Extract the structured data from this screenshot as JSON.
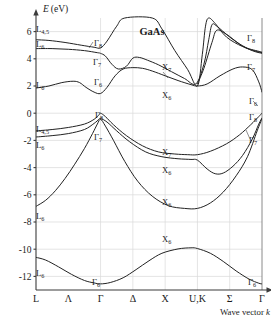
{
  "figure": {
    "material_label": "GaAs",
    "y_axis_title": "E",
    "y_axis_unit": "(eV)",
    "x_axis_title": "Wave vector",
    "x_axis_symbol": "k"
  },
  "chart_data": {
    "type": "line",
    "title": "GaAs",
    "subtitle": "",
    "xlabel": "Wave vector k",
    "ylabel": "E (eV)",
    "ylim": [
      -13,
      7
    ],
    "xlim": [
      0,
      8
    ],
    "grid": true,
    "legend_position": "none",
    "yticks": [
      6,
      4,
      2,
      0,
      -2,
      -4,
      -6,
      -8,
      -10,
      -12
    ],
    "ytick_labels": [
      "6",
      "4",
      "2",
      "0",
      "-2",
      "-4",
      "-6",
      "-8",
      "-10",
      "-12"
    ],
    "xticks": [
      0,
      1,
      2,
      3,
      4,
      5,
      6,
      7
    ],
    "xtick_labels": [
      "L",
      "Λ",
      "Γ",
      "Δ",
      "X",
      "U,K",
      "Σ",
      "Γ"
    ],
    "high_symmetry_points": [
      "L",
      "Λ",
      "Γ",
      "Δ",
      "X",
      "U,K",
      "Σ",
      "Γ"
    ],
    "gridline_x_positions": [
      2,
      3,
      4,
      5,
      6
    ],
    "series": [
      {
        "name": "cb4",
        "comment": "upper conduction band, L4,5 -> Gamma8 -> rises -> X upper -> Gamma8",
        "points": [
          [
            0,
            5.4
          ],
          [
            0.4,
            5.35
          ],
          [
            0.9,
            5.2
          ],
          [
            1.4,
            5.0
          ],
          [
            1.8,
            4.85
          ],
          [
            2.0,
            4.8
          ],
          [
            2.2,
            5.3
          ],
          [
            2.5,
            6.4
          ],
          [
            2.75,
            7.0
          ],
          [
            3.6,
            7.0
          ],
          [
            3.9,
            6.2
          ],
          [
            4.3,
            4.6
          ],
          [
            4.7,
            3.2
          ],
          [
            5.0,
            2.0
          ],
          [
            5.15,
            4.3
          ],
          [
            5.25,
            6.4
          ],
          [
            5.35,
            7.0
          ],
          [
            5.55,
            6.6
          ],
          [
            5.9,
            5.6
          ],
          [
            6.4,
            4.9
          ],
          [
            6.9,
            4.55
          ],
          [
            7.0,
            4.5
          ]
        ]
      },
      {
        "name": "cb3",
        "comment": "L6 band ~4.7 at L, to Gamma7, dips",
        "points": [
          [
            0,
            4.75
          ],
          [
            0.5,
            4.75
          ],
          [
            1.0,
            4.7
          ],
          [
            1.5,
            4.6
          ],
          [
            1.9,
            4.45
          ],
          [
            2.0,
            4.4
          ],
          [
            2.15,
            4.2
          ],
          [
            2.35,
            3.6
          ],
          [
            2.55,
            3.25
          ],
          [
            2.8,
            3.45
          ],
          [
            3.0,
            4.05
          ],
          [
            3.2,
            4.1
          ],
          [
            3.45,
            3.9
          ],
          [
            3.8,
            3.55
          ],
          [
            4.2,
            3.05
          ],
          [
            4.6,
            2.55
          ],
          [
            4.95,
            2.15
          ],
          [
            5.2,
            3.6
          ],
          [
            5.35,
            5.4
          ],
          [
            5.45,
            6.5
          ],
          [
            5.6,
            6.4
          ],
          [
            6.0,
            5.6
          ],
          [
            6.5,
            4.8
          ],
          [
            7.0,
            4.45
          ]
        ]
      },
      {
        "name": "cb3b",
        "comment": "companion to cb3 on Sigma branch (split)",
        "points": [
          [
            5.0,
            2.15
          ],
          [
            5.2,
            3.3
          ],
          [
            5.45,
            5.2
          ],
          [
            5.6,
            6.1
          ],
          [
            5.9,
            5.8
          ],
          [
            6.3,
            5.1
          ],
          [
            6.7,
            4.6
          ],
          [
            7.0,
            4.4
          ]
        ]
      },
      {
        "name": "cb1",
        "comment": "lowest conduction band L6 1.8 -> Gamma6 1.4 -> X6 2.0 -> Gamma6 1.5",
        "points": [
          [
            0,
            1.85
          ],
          [
            0.4,
            2.0
          ],
          [
            0.8,
            2.25
          ],
          [
            1.15,
            2.35
          ],
          [
            1.35,
            2.25
          ],
          [
            1.55,
            1.9
          ],
          [
            1.8,
            1.55
          ],
          [
            2.0,
            1.45
          ],
          [
            2.2,
            1.9
          ],
          [
            2.45,
            2.75
          ],
          [
            2.7,
            3.25
          ],
          [
            3.0,
            3.35
          ],
          [
            3.3,
            3.3
          ],
          [
            3.6,
            3.1
          ],
          [
            4.0,
            2.75
          ],
          [
            4.4,
            2.4
          ],
          [
            4.8,
            2.1
          ],
          [
            5.0,
            2.0
          ],
          [
            5.3,
            2.15
          ],
          [
            5.7,
            2.75
          ],
          [
            6.1,
            3.25
          ],
          [
            6.4,
            3.4
          ],
          [
            6.7,
            3.2
          ],
          [
            6.9,
            2.3
          ],
          [
            7.0,
            1.55
          ]
        ]
      },
      {
        "name": "vb1",
        "comment": "heavy hole: L4,5 -1.3 -> Gamma8 0 -> X7 -2.9 -> Gamma8 0",
        "points": [
          [
            0,
            -1.3
          ],
          [
            0.5,
            -1.2
          ],
          [
            1.0,
            -1.05
          ],
          [
            1.5,
            -0.8
          ],
          [
            1.8,
            -0.45
          ],
          [
            1.95,
            -0.12
          ],
          [
            2.0,
            0.0
          ],
          [
            2.15,
            -0.25
          ],
          [
            2.4,
            -0.85
          ],
          [
            2.8,
            -1.65
          ],
          [
            3.3,
            -2.4
          ],
          [
            3.8,
            -2.85
          ],
          [
            4.3,
            -3.0
          ],
          [
            4.7,
            -3.05
          ],
          [
            5.0,
            -3.05
          ],
          [
            5.4,
            -2.8
          ],
          [
            5.9,
            -2.25
          ],
          [
            6.3,
            -1.6
          ],
          [
            6.65,
            -0.85
          ],
          [
            6.9,
            -0.25
          ],
          [
            7.0,
            0.0
          ]
        ]
      },
      {
        "name": "vb2",
        "comment": "light hole: L6 -1.7 -> Gamma7 -0.35 -> X6 -3.3 -> Gamma7 ~-0.3",
        "points": [
          [
            0,
            -1.75
          ],
          [
            0.5,
            -1.65
          ],
          [
            1.0,
            -1.5
          ],
          [
            1.5,
            -1.2
          ],
          [
            1.8,
            -0.75
          ],
          [
            1.95,
            -0.45
          ],
          [
            2.0,
            -0.38
          ],
          [
            2.2,
            -0.65
          ],
          [
            2.5,
            -1.3
          ],
          [
            2.9,
            -2.1
          ],
          [
            3.4,
            -2.85
          ],
          [
            3.9,
            -3.2
          ],
          [
            4.4,
            -3.35
          ],
          [
            4.8,
            -3.4
          ],
          [
            5.0,
            -3.45
          ],
          [
            5.3,
            -4.1
          ],
          [
            5.55,
            -4.45
          ],
          [
            5.8,
            -4.4
          ],
          [
            6.1,
            -3.9
          ],
          [
            6.4,
            -3.1
          ],
          [
            6.7,
            -1.9
          ],
          [
            6.9,
            -0.8
          ],
          [
            7.0,
            -0.35
          ]
        ]
      },
      {
        "name": "vb3",
        "comment": "split-off / deep: L6 -6.8 -> Gamma7 -0.45 -> X6 -7.0 -> Gamma7",
        "points": [
          [
            0,
            -6.85
          ],
          [
            0.3,
            -6.4
          ],
          [
            0.6,
            -5.7
          ],
          [
            0.9,
            -4.8
          ],
          [
            1.2,
            -3.75
          ],
          [
            1.5,
            -2.6
          ],
          [
            1.75,
            -1.5
          ],
          [
            1.9,
            -0.8
          ],
          [
            2.0,
            -0.45
          ],
          [
            2.15,
            -0.95
          ],
          [
            2.4,
            -2.0
          ],
          [
            2.75,
            -3.55
          ],
          [
            3.15,
            -5.0
          ],
          [
            3.6,
            -6.1
          ],
          [
            4.1,
            -6.8
          ],
          [
            4.6,
            -7.0
          ],
          [
            5.0,
            -7.0
          ],
          [
            5.4,
            -6.6
          ],
          [
            5.8,
            -5.8
          ],
          [
            6.2,
            -4.6
          ],
          [
            6.55,
            -3.2
          ],
          [
            6.85,
            -1.3
          ],
          [
            7.0,
            -0.4
          ]
        ]
      },
      {
        "name": "vb4",
        "comment": "lowest valence band: L6 -10.6 -> Gamma6 -12.5 -> X6 -9.9 -> Gamma6 -12.5",
        "points": [
          [
            0,
            -10.6
          ],
          [
            0.3,
            -10.8
          ],
          [
            0.7,
            -11.3
          ],
          [
            1.1,
            -11.85
          ],
          [
            1.5,
            -12.3
          ],
          [
            1.8,
            -12.48
          ],
          [
            2.0,
            -12.55
          ],
          [
            2.3,
            -12.45
          ],
          [
            2.7,
            -12.1
          ],
          [
            3.1,
            -11.5
          ],
          [
            3.5,
            -10.85
          ],
          [
            3.9,
            -10.3
          ],
          [
            4.4,
            -9.98
          ],
          [
            4.8,
            -9.9
          ],
          [
            5.0,
            -9.95
          ],
          [
            5.4,
            -10.3
          ],
          [
            5.8,
            -10.9
          ],
          [
            6.2,
            -11.6
          ],
          [
            6.6,
            -12.2
          ],
          [
            6.9,
            -12.5
          ],
          [
            7.0,
            -12.55
          ]
        ]
      }
    ],
    "annotations": [
      {
        "id": "ann-l45-top",
        "text": "L",
        "sub": "4,5",
        "x": 36,
        "y": 32
      },
      {
        "id": "ann-l6-upper",
        "text": "L",
        "sub": "6",
        "x": 36,
        "y": 47
      },
      {
        "id": "ann-l6-cb",
        "text": "L",
        "sub": "6",
        "x": 36,
        "y": 88
      },
      {
        "id": "ann-l45-vb",
        "text": "L",
        "sub": "4,5",
        "x": 36,
        "y": 132
      },
      {
        "id": "ann-l6-vb",
        "text": "L",
        "sub": "6",
        "x": 36,
        "y": 148
      },
      {
        "id": "ann-l6-deep",
        "text": "L",
        "sub": "6",
        "x": 36,
        "y": 219
      },
      {
        "id": "ann-l6-bottom",
        "text": "L",
        "sub": "6",
        "x": 36,
        "y": 276
      },
      {
        "id": "ann-g8-cb",
        "text": "Γ",
        "sub": "8",
        "x": 94,
        "y": 46
      },
      {
        "id": "ann-g7-cb",
        "text": "Γ",
        "sub": "7",
        "x": 93,
        "y": 65
      },
      {
        "id": "ann-g6-cb",
        "text": "Γ",
        "sub": "6",
        "x": 94,
        "y": 85
      },
      {
        "id": "ann-g8-vb",
        "text": "Γ",
        "sub": "8",
        "x": 95,
        "y": 118
      },
      {
        "id": "ann-g7-vb",
        "text": "Γ",
        "sub": "7",
        "x": 94,
        "y": 140
      },
      {
        "id": "ann-g6-bottom",
        "text": "Γ",
        "sub": "6",
        "x": 92,
        "y": 285
      },
      {
        "id": "ann-x7-cb",
        "text": "X",
        "sub": "7",
        "x": 162,
        "y": 70
      },
      {
        "id": "ann-x6-cb",
        "text": "X",
        "sub": "6",
        "x": 162,
        "y": 98
      },
      {
        "id": "ann-x7-vb",
        "text": "X",
        "sub": "7",
        "x": 162,
        "y": 155
      },
      {
        "id": "ann-x6-vb",
        "text": "X",
        "sub": "6",
        "x": 162,
        "y": 173
      },
      {
        "id": "ann-x6-deep",
        "text": "X",
        "sub": "6",
        "x": 162,
        "y": 205
      },
      {
        "id": "ann-x6-bottom",
        "text": "X",
        "sub": "6",
        "x": 162,
        "y": 242
      },
      {
        "id": "ann-g8-right",
        "text": "Γ",
        "sub": "8",
        "x": 247,
        "y": 41
      },
      {
        "id": "ann-g7-right",
        "text": "Γ",
        "sub": "7",
        "x": 247,
        "y": 70
      },
      {
        "id": "ann-g6-right",
        "text": "Γ",
        "sub": "6",
        "x": 249,
        "y": 104
      },
      {
        "id": "ann-g8-right-vb",
        "text": "Γ",
        "sub": "8",
        "x": 249,
        "y": 120
      },
      {
        "id": "ann-g7-right-vb",
        "text": "Γ",
        "sub": "7",
        "x": 249,
        "y": 143
      },
      {
        "id": "ann-g6-right-bot",
        "text": "Γ",
        "sub": "6",
        "x": 248,
        "y": 285
      }
    ]
  },
  "plot_geometry": {
    "left": 36,
    "right": 262,
    "top": 18,
    "bottom": 290,
    "y_min": -13,
    "y_max": 7,
    "x_min": 0,
    "x_max": 7
  }
}
